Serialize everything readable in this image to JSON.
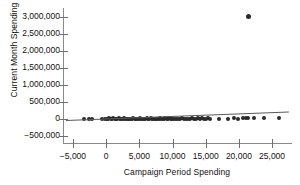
{
  "chart_data": {
    "type": "scatter",
    "title": "",
    "xlabel": "Campaign Period Spending",
    "ylabel": "Current Month Spending",
    "xlim": [
      -6500,
      28000
    ],
    "ylim": [
      -700000,
      3250000
    ],
    "xticks": [
      -5000,
      0,
      5000,
      10000,
      15000,
      20000,
      25000
    ],
    "xtick_labels": [
      "−5,000",
      "0",
      "5,000",
      "10,000",
      "15,000",
      "20,000",
      "25,000"
    ],
    "yticks": [
      -500000,
      0,
      500000,
      1000000,
      1500000,
      2000000,
      2500000,
      3000000
    ],
    "ytick_labels": [
      "−500,000",
      "0",
      "500,000",
      "1,000,000",
      "1,500,000",
      "2,000,000",
      "2,500,000",
      "3,000,000"
    ],
    "grid": false,
    "legend": null,
    "marker_color": "#2a2a2a",
    "trendline_color": "#5a5a5a",
    "series": [
      {
        "name": "observations",
        "points": [
          [
            -3400,
            10000
          ],
          [
            -2600,
            5000
          ],
          [
            -2100,
            -8000
          ],
          [
            -600,
            2000
          ],
          [
            -200,
            15000
          ],
          [
            100,
            -5000
          ],
          [
            300,
            8000
          ],
          [
            500,
            20000
          ],
          [
            700,
            -12000
          ],
          [
            900,
            5000
          ],
          [
            1100,
            25000
          ],
          [
            1300,
            -3000
          ],
          [
            1500,
            12000
          ],
          [
            1700,
            3000
          ],
          [
            1900,
            18000
          ],
          [
            2100,
            -6000
          ],
          [
            2300,
            9000
          ],
          [
            2500,
            1000
          ],
          [
            2700,
            22000
          ],
          [
            2900,
            -9000
          ],
          [
            3100,
            7000
          ],
          [
            3300,
            14000
          ],
          [
            3500,
            -2000
          ],
          [
            3700,
            11000
          ],
          [
            3900,
            4000
          ],
          [
            4100,
            19000
          ],
          [
            4300,
            -7000
          ],
          [
            4500,
            6000
          ],
          [
            4700,
            16000
          ],
          [
            4900,
            2000
          ],
          [
            5100,
            23000
          ],
          [
            5300,
            -4000
          ],
          [
            5500,
            10000
          ],
          [
            5700,
            13000
          ],
          [
            5900,
            1000
          ],
          [
            6100,
            17000
          ],
          [
            6300,
            -5000
          ],
          [
            6500,
            8000
          ],
          [
            6700,
            21000
          ],
          [
            6900,
            3000
          ],
          [
            7100,
            12000
          ],
          [
            7300,
            -8000
          ],
          [
            7500,
            9000
          ],
          [
            7700,
            15000
          ],
          [
            7900,
            2000
          ],
          [
            8100,
            24000
          ],
          [
            8300,
            -3000
          ],
          [
            8500,
            11000
          ],
          [
            8700,
            6000
          ],
          [
            8900,
            18000
          ],
          [
            9100,
            -6000
          ],
          [
            9300,
            7000
          ],
          [
            9500,
            20000
          ],
          [
            9700,
            4000
          ],
          [
            9900,
            13000
          ],
          [
            10200,
            -4000
          ],
          [
            10500,
            10000
          ],
          [
            10800,
            16000
          ],
          [
            11100,
            2000
          ],
          [
            11400,
            22000
          ],
          [
            11700,
            -7000
          ],
          [
            12000,
            8000
          ],
          [
            12300,
            14000
          ],
          [
            12600,
            5000
          ],
          [
            12900,
            19000
          ],
          [
            13200,
            -2000
          ],
          [
            13500,
            11000
          ],
          [
            13800,
            26000
          ],
          [
            14100,
            3000
          ],
          [
            14400,
            17000
          ],
          [
            14700,
            -5000
          ],
          [
            15000,
            9000
          ],
          [
            15300,
            21000
          ],
          [
            15600,
            6000
          ],
          [
            17000,
            12000
          ],
          [
            18300,
            8000
          ],
          [
            19200,
            40000
          ],
          [
            19900,
            15000
          ],
          [
            20600,
            30000
          ],
          [
            21000,
            18000
          ],
          [
            21400,
            45000
          ],
          [
            22200,
            22000
          ],
          [
            23800,
            28000
          ],
          [
            26000,
            35000
          ],
          [
            21500,
            3000000
          ]
        ]
      }
    ],
    "trendline": {
      "name": "linear fit",
      "x_start": -6000,
      "y_start": -40000,
      "x_end": 27500,
      "y_end": 210000
    }
  }
}
